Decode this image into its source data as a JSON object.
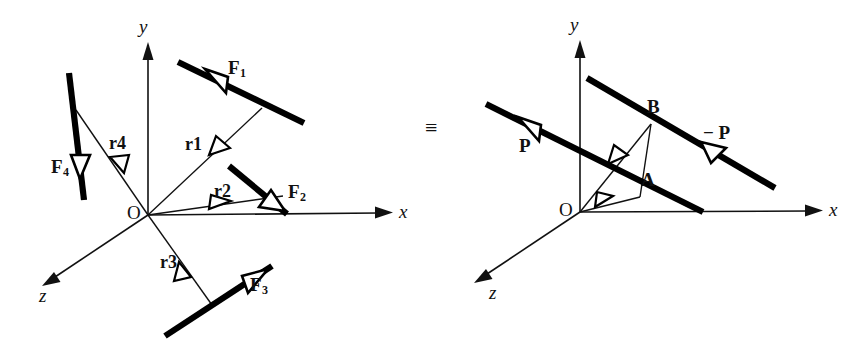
{
  "figure": {
    "caption_equivalence_symbol": "≡",
    "width": 867,
    "height": 354,
    "ink_color": "#000000",
    "paper_color": "#ffffff"
  },
  "left_diagram": {
    "name": "system-of-four-forces",
    "origin_label": "O",
    "axes": [
      {
        "id": "x",
        "label": "x"
      },
      {
        "id": "y",
        "label": "y"
      },
      {
        "id": "z",
        "label": "z"
      }
    ],
    "forces": [
      {
        "id": "F1",
        "base": "F",
        "sub": "1"
      },
      {
        "id": "F2",
        "base": "F",
        "sub": "2"
      },
      {
        "id": "F3",
        "base": "F",
        "sub": "3"
      },
      {
        "id": "F4",
        "base": "F",
        "sub": "4"
      }
    ],
    "position_vectors": [
      {
        "id": "r1",
        "base": "r",
        "sub": "1"
      },
      {
        "id": "r2",
        "base": "r",
        "sub": "2"
      },
      {
        "id": "r3",
        "base": "r",
        "sub": "3"
      },
      {
        "id": "r4",
        "base": "r",
        "sub": "4"
      }
    ]
  },
  "right_diagram": {
    "name": "equivalent-couple",
    "origin_label": "O",
    "axes": [
      {
        "id": "x",
        "label": "x"
      },
      {
        "id": "y",
        "label": "y"
      },
      {
        "id": "z",
        "label": "z"
      }
    ],
    "forces": [
      {
        "id": "P",
        "label": "P"
      },
      {
        "id": "minusP",
        "label": "− P"
      }
    ],
    "points": [
      {
        "id": "A",
        "label": "A"
      },
      {
        "id": "B",
        "label": "B"
      }
    ]
  }
}
